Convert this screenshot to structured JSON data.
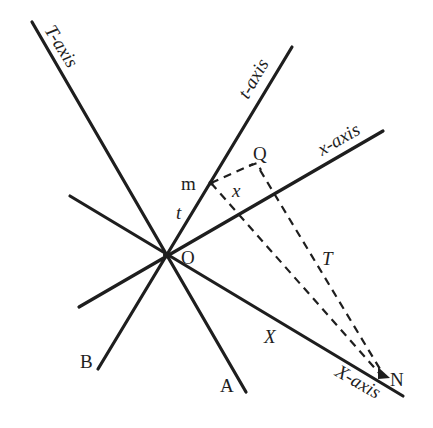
{
  "diagram": {
    "origin_label": "O",
    "axes": {
      "T_axis": "T-axis",
      "t_axis": "t-axis",
      "x_axis": "x-axis",
      "X_axis": "X-axis"
    },
    "points": {
      "m": "m",
      "Q": "Q",
      "N": "N",
      "A": "A",
      "B": "B"
    },
    "segment_labels": {
      "x": "x",
      "t": "t",
      "T": "T",
      "X": "X"
    },
    "colors": {
      "line": "#1e1e1e",
      "background": "#ffffff"
    }
  }
}
